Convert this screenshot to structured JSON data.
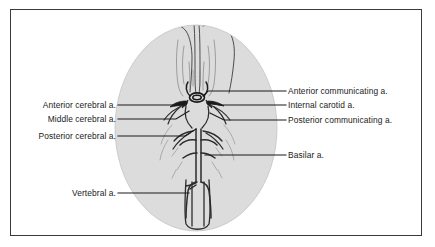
{
  "figure": {
    "border_color": "#3a3a3a",
    "background_color": "#ffffff",
    "brain_fill_color": "#dcdcdc",
    "ink_color": "#2b2b2b",
    "leader_line_color": "#1a1a1a"
  },
  "labels": {
    "left": [
      {
        "id": "anterior-cerebral",
        "text": "Anterior cerebral a.",
        "text_right_x": 116,
        "text_y": 105,
        "leader": "M118,105 L186,105"
      },
      {
        "id": "middle-cerebral",
        "text": "Middle cerebral a.",
        "text_right_x": 116,
        "text_y": 119,
        "leader": "M118,119 L176,119 L189,111"
      },
      {
        "id": "posterior-cerebral",
        "text": "Posterior cerebral a.",
        "text_right_x": 116,
        "text_y": 136,
        "leader": "M118,136 L185,136 L196,129"
      },
      {
        "id": "vertebral",
        "text": "Vertebral a.",
        "text_right_x": 116,
        "text_y": 193,
        "leader": "M118,193 L189,193"
      }
    ],
    "right": [
      {
        "id": "anterior-communicating",
        "text": "Anterior communicating a.",
        "text_left_x": 288,
        "text_y": 91,
        "leader": "M286,91 L208,91 L203,96"
      },
      {
        "id": "internal-carotid",
        "text": "Internal carotid a.",
        "text_left_x": 288,
        "text_y": 105,
        "leader": "M286,105 L219,105"
      },
      {
        "id": "posterior-communicating",
        "text": "Posterior communicating a.",
        "text_left_x": 288,
        "text_y": 120,
        "leader": "M286,120 L224,120 L210,113"
      },
      {
        "id": "basilar",
        "text": "Basilar a.",
        "text_left_x": 288,
        "text_y": 155,
        "leader": "M286,155 L205,155"
      }
    ]
  },
  "anatomy": {
    "brain_outline_name": "brain-silhouette",
    "structures": [
      "frontal-lobes",
      "longitudinal-fissure",
      "anterior-cerebral-arteries",
      "anterior-communicating-artery",
      "internal-carotid-arteries",
      "middle-cerebral-arteries",
      "posterior-communicating-arteries",
      "posterior-cerebral-arteries",
      "basilar-artery",
      "vertebral-arteries",
      "brainstem"
    ]
  }
}
